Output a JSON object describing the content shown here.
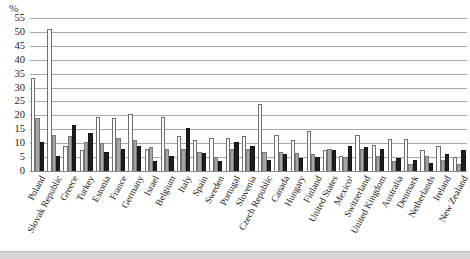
{
  "axis": {
    "unit_label": "%",
    "tick_labels": [
      "0",
      "5",
      "10",
      "15",
      "20",
      "25",
      "30",
      "35",
      "40",
      "45",
      "50",
      "55"
    ]
  },
  "chart_data": {
    "type": "bar",
    "title": "",
    "xlabel": "",
    "ylabel": "%",
    "ylim": [
      0,
      55
    ],
    "tick_step": 5,
    "grid": "horizontal",
    "legend_position": "none",
    "categories": [
      "Poland",
      "Slovak Republic",
      "Greece",
      "Turkey",
      "Estonia",
      "France",
      "Germany",
      "Israel",
      "Belgium",
      "Italy",
      "Spain",
      "Sweden",
      "Portugal",
      "Slovenia",
      "Czech Republic",
      "Canada",
      "Hungary",
      "Finland",
      "United States",
      "Mexico¹",
      "Switzerland",
      "United Kingdom",
      "Australia",
      "Denmark",
      "Netherlands",
      "Ireland",
      "New Zealand"
    ],
    "series": [
      {
        "name": "series-1-white",
        "color": "#fcfbf8",
        "border_color": "#6f6f6f",
        "values": [
          33.5,
          51,
          9,
          7.5,
          19.5,
          19,
          20.5,
          8,
          19.5,
          12.5,
          11,
          12,
          12,
          12.5,
          24,
          13,
          11,
          14.5,
          7.5,
          5.5,
          13,
          9.5,
          11.5,
          11.5,
          7.5,
          9,
          5
        ]
      },
      {
        "name": "series-2-gray",
        "color": "#a5a5a5",
        "border_color": "#787878",
        "values": [
          19,
          13,
          12.5,
          10.5,
          10,
          12,
          11,
          8.5,
          8,
          8,
          7,
          5,
          8,
          8,
          7,
          7,
          6.5,
          6,
          8,
          5,
          8,
          5.5,
          3.5,
          2.5,
          5.5,
          4,
          2.5
        ]
      },
      {
        "name": "series-3-black",
        "color": "#1f1f1f",
        "border_color": "#141414",
        "values": [
          10.5,
          5.5,
          16.5,
          13.5,
          7,
          8,
          9,
          3.5,
          5.5,
          15.5,
          6.5,
          3.5,
          10.5,
          9,
          4,
          6,
          4.5,
          5,
          7.5,
          9,
          8.5,
          8,
          4.5,
          4,
          3,
          6,
          7.5
        ]
      }
    ]
  }
}
